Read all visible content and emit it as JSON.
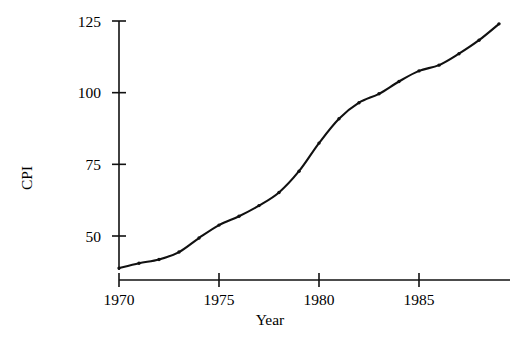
{
  "chart_data": {
    "type": "line",
    "title": "",
    "xlabel": "Year",
    "ylabel": "CPI",
    "xlim": [
      1969.2,
      1989.8
    ],
    "ylim": [
      36,
      128
    ],
    "grid": false,
    "legend": null,
    "xticks": [
      1970,
      1975,
      1980,
      1985
    ],
    "xticklabels": [
      "1970",
      "1975",
      "1980",
      "1985"
    ],
    "yticks": [
      50,
      75,
      100,
      125
    ],
    "yticklabels": [
      "50",
      "75",
      "100",
      "125"
    ],
    "marker": "point",
    "line_color": "#111111",
    "x": [
      1970,
      1971,
      1972,
      1973,
      1974,
      1975,
      1976,
      1977,
      1978,
      1979,
      1980,
      1981,
      1982,
      1983,
      1984,
      1985,
      1986,
      1987,
      1988,
      1989
    ],
    "values": [
      38.8,
      40.5,
      41.8,
      44.4,
      49.3,
      53.8,
      56.9,
      60.6,
      65.2,
      72.6,
      82.4,
      90.9,
      96.5,
      99.6,
      103.9,
      107.6,
      109.6,
      113.6,
      118.3,
      124.0
    ],
    "series": [
      {
        "name": "CPI",
        "x": [
          1970,
          1971,
          1972,
          1973,
          1974,
          1975,
          1976,
          1977,
          1978,
          1979,
          1980,
          1981,
          1982,
          1983,
          1984,
          1985,
          1986,
          1987,
          1988,
          1989
        ],
        "values": [
          38.8,
          40.5,
          41.8,
          44.4,
          49.3,
          53.8,
          56.9,
          60.6,
          65.2,
          72.6,
          82.4,
          90.9,
          96.5,
          99.6,
          103.9,
          107.6,
          109.6,
          113.6,
          118.3,
          124.0
        ]
      }
    ]
  }
}
